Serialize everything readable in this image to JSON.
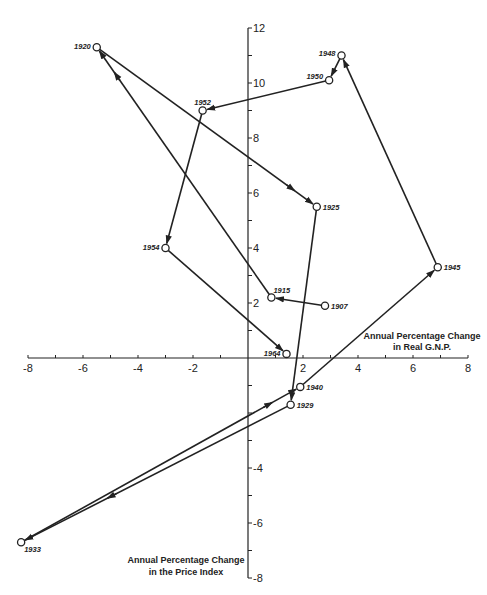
{
  "chart_data": {
    "type": "line",
    "title": "",
    "xlabel": "Annual Percentage Change in Real G.N.P.",
    "ylabel": "Annual Percentage Change in the Price Index",
    "xlabel_lines": [
      "Annual Percentage Change",
      "in Real G.N.P."
    ],
    "ylabel_lines": [
      "Annual Percentage Change",
      "in the Price Index"
    ],
    "xlim": [
      -8,
      8
    ],
    "ylim": [
      -8,
      12
    ],
    "x_ticks": [
      -8,
      -6,
      -4,
      -2,
      2,
      4,
      6,
      8
    ],
    "y_ticks": [
      12,
      10,
      8,
      6,
      4,
      2,
      -4,
      -6,
      -8
    ],
    "grid": false,
    "legend": null,
    "connected_path": true,
    "points": [
      {
        "label": "1907",
        "x": 2.8,
        "y": 1.9
      },
      {
        "label": "1915",
        "x": 0.85,
        "y": 2.2
      },
      {
        "label": "1920",
        "x": -5.5,
        "y": 11.3
      },
      {
        "label": "1925",
        "x": 2.5,
        "y": 5.5
      },
      {
        "label": "1929",
        "x": 1.55,
        "y": -1.7
      },
      {
        "label": "1933",
        "x": -8.25,
        "y": -6.7
      },
      {
        "label": "1940",
        "x": 1.9,
        "y": -1.05
      },
      {
        "label": "1945",
        "x": 6.9,
        "y": 3.3
      },
      {
        "label": "1948",
        "x": 3.4,
        "y": 11.0
      },
      {
        "label": "1950",
        "x": 2.95,
        "y": 10.1
      },
      {
        "label": "1952",
        "x": -1.65,
        "y": 9.0
      },
      {
        "label": "1954",
        "x": -3.0,
        "y": 4.0
      },
      {
        "label": "1964",
        "x": 1.4,
        "y": 0.15
      }
    ]
  },
  "colors": {
    "line": "#222222",
    "background": "#ffffff"
  }
}
